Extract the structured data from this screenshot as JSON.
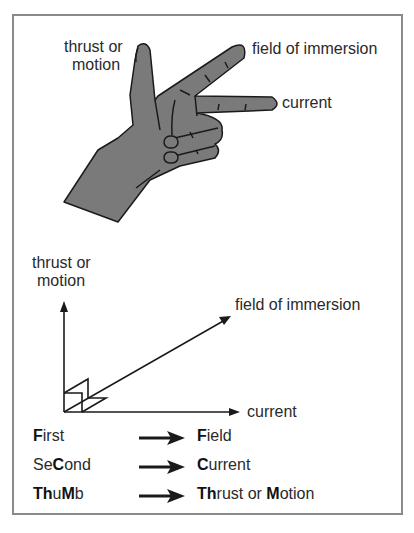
{
  "hand_labels": {
    "thumb_line1": "thrust or",
    "thumb_line2": "motion",
    "first_finger": "field of immersion",
    "second_finger": "current"
  },
  "axes_labels": {
    "vertical_line1": "thrust or",
    "vertical_line2": "motion",
    "diagonal": "field of immersion",
    "horizontal": "current"
  },
  "legend": [
    {
      "finger_parts": [
        {
          "t": "F",
          "b": true
        },
        {
          "t": "irst",
          "b": false
        }
      ],
      "quantity_parts": [
        {
          "t": "F",
          "b": true
        },
        {
          "t": "ield",
          "b": false
        }
      ]
    },
    {
      "finger_parts": [
        {
          "t": "Se",
          "b": false
        },
        {
          "t": "C",
          "b": true
        },
        {
          "t": "ond",
          "b": false
        }
      ],
      "quantity_parts": [
        {
          "t": "C",
          "b": true
        },
        {
          "t": "urrent",
          "b": false
        }
      ]
    },
    {
      "finger_parts": [
        {
          "t": "Th",
          "b": true
        },
        {
          "t": "u",
          "b": false
        },
        {
          "t": "M",
          "b": true
        },
        {
          "t": "b",
          "b": false
        }
      ],
      "quantity_parts": [
        {
          "t": "Th",
          "b": true
        },
        {
          "t": "rust or ",
          "b": false
        },
        {
          "t": "M",
          "b": true
        },
        {
          "t": "otion",
          "b": false
        }
      ]
    }
  ],
  "colors": {
    "hand_fill": "#7a7a7a",
    "outline": "#1a1a1a",
    "frame": "#8a8a8a"
  }
}
